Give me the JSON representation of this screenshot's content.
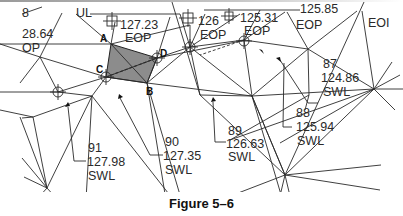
{
  "figure": {
    "caption": "Figure 5–6"
  },
  "colors": {
    "line": "#2a2a2a",
    "shaded_triangle": "#8c8c8c",
    "background": "#ffffff"
  },
  "vertex_labels": {
    "a": "A",
    "b": "B",
    "c": "C",
    "d": "D"
  },
  "top_labels": {
    "left_num": "28.64",
    "left_desc": "OP",
    "left_top": "8",
    "ul": "UL",
    "p127_23": "127.23",
    "eop1": "EOP",
    "p126": "126",
    "eop2": "EOP",
    "p125_31": "125.31",
    "eop3": "EOP",
    "p125_85": "125.85",
    "eop4": "EOI"
  },
  "points": [
    {
      "id": "87",
      "elevation": "124.86",
      "desc": "SWL"
    },
    {
      "id": "88",
      "elevation": "125.94",
      "desc": "SWL"
    },
    {
      "id": "89",
      "elevation": "126.63",
      "desc": "SWL"
    },
    {
      "id": "90",
      "elevation": "127.35",
      "desc": "SWL"
    },
    {
      "id": "91",
      "elevation": "127.98",
      "desc": "SWL"
    }
  ]
}
